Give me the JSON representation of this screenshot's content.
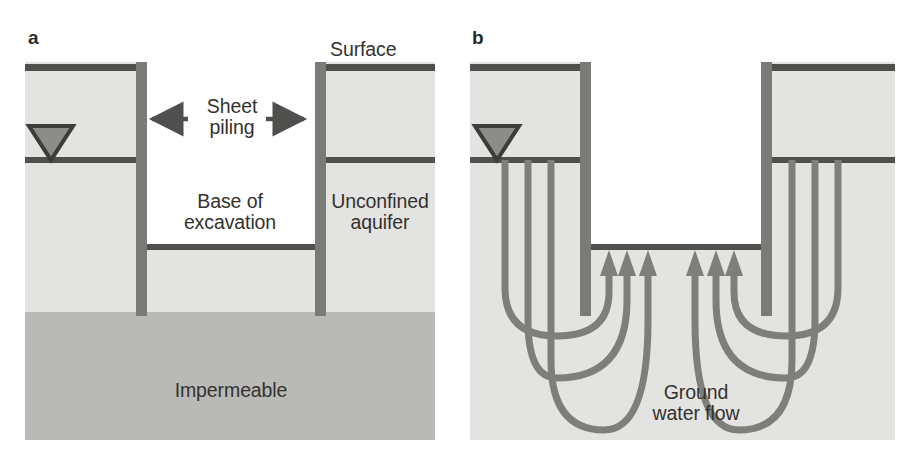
{
  "figure": {
    "width": 910,
    "height": 470,
    "background": "#ffffff"
  },
  "colors": {
    "aquifer_fill": "#e3e3e1",
    "impermeable_fill": "#b9b9b6",
    "line_dark": "#4f4f4d",
    "sheet_pile": "#7a7a76",
    "flow_line": "#7e7e7a",
    "excavation_fill": "#ffffff",
    "text": "#33322f",
    "water_symbol_fill": "#8c8c88",
    "water_symbol_stroke": "#3c3c3a"
  },
  "panels": [
    {
      "id": "a",
      "letter": "a",
      "letter_x": 28,
      "letter_y": 28,
      "frame": {
        "x": 25,
        "y": 62,
        "width": 410,
        "height": 378
      },
      "geometry": {
        "surface_y": 68,
        "water_table_y": 160,
        "excavation_base_y": 247,
        "impermeable_top_y": 312,
        "left_pile_x": 136,
        "right_pile_x": 316,
        "pile_width": 11,
        "pile_top_y": 58,
        "pile_bottom_y": 316
      },
      "labels": [
        {
          "name": "surface-label",
          "text": "Surface",
          "x": 330,
          "y": 40,
          "align": "left"
        },
        {
          "name": "sheet-piling-label",
          "text": "Sheet\npiling",
          "x": 196,
          "y": 97,
          "align": "center",
          "width": 100
        },
        {
          "name": "base-of-excavation-label",
          "text": "Base of\nexcavation",
          "x": 172,
          "y": 192,
          "align": "center",
          "width": 112
        },
        {
          "name": "unconfined-aquifer-label",
          "text": "Unconfined\naquifer",
          "x": 325,
          "y": 192,
          "align": "center",
          "width": 116
        },
        {
          "name": "impermeable-label",
          "text": "Impermeable",
          "x": 158,
          "y": 380,
          "align": "center",
          "width": 146
        }
      ],
      "annotation_arrows": [
        {
          "name": "arrow-to-left-pile",
          "from_x": 188,
          "to_x": 149,
          "y": 119,
          "direction": "left"
        },
        {
          "name": "arrow-to-right-pile",
          "from_x": 265,
          "to_x": 306,
          "y": 119,
          "direction": "right"
        }
      ],
      "water_table_symbol": {
        "name": "water-table-symbol",
        "cx": 51,
        "top_y": 124,
        "half_width": 22,
        "apex_y": 160
      }
    },
    {
      "id": "b",
      "letter": "b",
      "letter_x": 472,
      "letter_y": 28,
      "frame": {
        "x": 470,
        "y": 62,
        "width": 425,
        "height": 378
      },
      "geometry": {
        "surface_y": 68,
        "water_table_y": 160,
        "excavation_base_y": 247,
        "left_pile_x": 580,
        "right_pile_x": 762,
        "pile_width": 11,
        "pile_top_y": 58,
        "pile_bottom_y": 316
      },
      "labels": [
        {
          "name": "ground-water-flow-label",
          "text": "Ground\nwater flow",
          "x": 628,
          "y": 382,
          "align": "center",
          "width": 150
        }
      ],
      "water_table_symbol": {
        "name": "water-table-symbol",
        "cx": 497,
        "top_y": 124,
        "half_width": 22,
        "apex_y": 160
      },
      "flow_arrow_count": 6,
      "flow_lines": [
        {
          "side": "left",
          "index": 1,
          "start_x": 505,
          "end_x": 612,
          "bottom_y": 330
        },
        {
          "side": "left",
          "index": 2,
          "start_x": 528,
          "end_x": 630,
          "bottom_y": 372
        },
        {
          "side": "left",
          "index": 3,
          "start_x": 550,
          "end_x": 650,
          "bottom_y": 425
        },
        {
          "side": "right",
          "index": 1,
          "start_x": 838,
          "end_x": 731,
          "bottom_y": 330
        },
        {
          "side": "right",
          "index": 2,
          "start_x": 815,
          "end_x": 713,
          "bottom_y": 372
        },
        {
          "side": "right",
          "index": 3,
          "start_x": 793,
          "end_x": 693,
          "bottom_y": 425
        }
      ]
    }
  ],
  "legend_notes": {
    "diagram_type": "hydrogeology-cross-section",
    "panel_a_caption": "Excavation with sheet piling in unconfined aquifer above impermeable layer",
    "panel_b_caption": "Ground water flow paths beneath sheet piling into excavation"
  }
}
